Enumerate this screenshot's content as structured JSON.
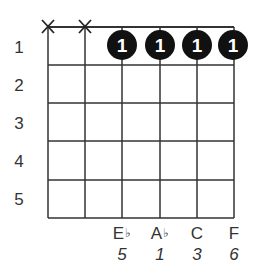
{
  "chord": {
    "strings": 6,
    "frets_shown": 5,
    "fret_labels": [
      "1",
      "2",
      "3",
      "4",
      "5"
    ],
    "muted_strings": [
      1,
      2
    ],
    "dots": [
      {
        "string": 3,
        "fret": 1,
        "finger": "1"
      },
      {
        "string": 4,
        "fret": 1,
        "finger": "1"
      },
      {
        "string": 5,
        "fret": 1,
        "finger": "1"
      },
      {
        "string": 6,
        "fret": 1,
        "finger": "1"
      }
    ],
    "notes": [
      {
        "string": 3,
        "name": "E",
        "accidental": "♭",
        "interval": "5"
      },
      {
        "string": 4,
        "name": "A",
        "accidental": "♭",
        "interval": "1"
      },
      {
        "string": 5,
        "name": "C",
        "accidental": "",
        "interval": "3"
      },
      {
        "string": 6,
        "name": "F",
        "accidental": "",
        "interval": "6"
      }
    ],
    "mute_symbol": "X"
  },
  "colors": {
    "grid": "#333333",
    "dot": "#111111",
    "dot_text": "#ffffff"
  }
}
